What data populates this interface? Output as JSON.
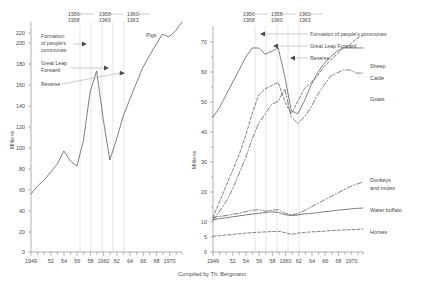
{
  "caption": "Compiled by Th. Bergmann",
  "axis_title": "Millions",
  "periods": [
    {
      "line1": "1956-",
      "line2": "1958"
    },
    {
      "line1": "1958-",
      "line2": "1960"
    },
    {
      "line1": "1960-",
      "line2": "1963"
    }
  ],
  "annotations": {
    "communes_l1": "Formation",
    "communes_l2": "of people's",
    "communes_l3": "communes",
    "glf_l1": "Great Leap",
    "glf_l2": "Forward",
    "reverse": "Reverse",
    "communes_full": "Formation of people's communes",
    "glf_full": "Great Leap Forward",
    "reverse_full": "Reverse"
  },
  "chart_data": [
    {
      "type": "line",
      "title": "",
      "xlabel": "",
      "ylabel": "Millions",
      "xlim": [
        1949,
        1972
      ],
      "ylim": [
        0,
        230
      ],
      "yticks": [
        0,
        20,
        40,
        60,
        80,
        100,
        120,
        140,
        160,
        180,
        200,
        220
      ],
      "xticks": [
        1949,
        1952,
        1954,
        1956,
        1958,
        1960,
        1962,
        1964,
        1966,
        1968,
        1970
      ],
      "xticklabels": [
        "1949",
        "52",
        "54",
        "56",
        "58",
        "1960",
        "62",
        "64",
        "66",
        "68",
        "1970"
      ],
      "grid": false,
      "legend": "inline",
      "series": [
        {
          "name": "Pigs",
          "style": "solid",
          "x": [
            1949,
            1950,
            1951,
            1952,
            1953,
            1954,
            1955,
            1956,
            1957,
            1958,
            1959,
            1960,
            1961,
            1962,
            1963,
            1964,
            1965,
            1966,
            1967,
            1968,
            1969,
            1970,
            1971,
            1972
          ],
          "values": [
            58,
            66,
            72,
            80,
            88,
            101,
            91,
            86,
            112,
            160,
            181,
            133,
            92,
            112,
            135,
            152,
            168,
            184,
            196,
            207,
            218,
            215,
            221,
            230
          ]
        }
      ]
    },
    {
      "type": "line",
      "title": "",
      "xlabel": "",
      "ylabel": "Millions",
      "xlim": [
        1949,
        1972
      ],
      "ylim": [
        0,
        72
      ],
      "yticks": [
        0,
        10,
        20,
        30,
        40,
        50,
        60,
        70
      ],
      "xticks": [
        1949,
        1952,
        1954,
        1956,
        1958,
        1960,
        1962,
        1964,
        1966,
        1968,
        1970
      ],
      "xticklabels": [
        "1949",
        "52",
        "54",
        "56",
        "58",
        "1960",
        "62",
        "64",
        "66",
        "68",
        "1970"
      ],
      "grid": false,
      "legend": "right-inline",
      "series": [
        {
          "name": "Sheep",
          "style": "solid",
          "x": [
            1949,
            1950,
            1951,
            1952,
            1953,
            1954,
            1955,
            1956,
            1957,
            1958,
            1959,
            1960,
            1961,
            1962,
            1963,
            1964,
            1965,
            1966,
            1967,
            1968,
            1969,
            1970,
            1971,
            1972
          ],
          "values": [
            43,
            46,
            50,
            54,
            58,
            62,
            65,
            65,
            63,
            64,
            65,
            56,
            45,
            44,
            48,
            53,
            57,
            60,
            62,
            64,
            65,
            65,
            65,
            65
          ]
        },
        {
          "name": "Cattle",
          "style": "dashed",
          "x": [
            1949,
            1950,
            1951,
            1952,
            1953,
            1954,
            1955,
            1956,
            1957,
            1958,
            1959,
            1960,
            1961,
            1962,
            1963,
            1964,
            1965,
            1966,
            1967,
            1968,
            1969,
            1970,
            1971,
            1972
          ],
          "values": [
            11,
            16,
            21,
            26,
            31,
            37,
            44,
            50,
            52,
            53,
            54,
            48,
            44,
            48,
            52,
            54,
            56,
            59,
            61,
            63,
            65,
            66,
            68,
            69
          ]
        },
        {
          "name": "Goats",
          "style": "dashdot",
          "x": [
            1949,
            1950,
            1951,
            1952,
            1953,
            1954,
            1955,
            1956,
            1957,
            1958,
            1959,
            1960,
            1961,
            1962,
            1963,
            1964,
            1965,
            1966,
            1967,
            1968,
            1969,
            1970,
            1971,
            1972
          ],
          "values": [
            10,
            13,
            16,
            20,
            25,
            30,
            36,
            41,
            44,
            47,
            48,
            52,
            43,
            41,
            43,
            46,
            50,
            53,
            56,
            57,
            58,
            58,
            57,
            57
          ]
        },
        {
          "name": "Donkeys and mules",
          "style": "dashdot",
          "x": [
            1949,
            1950,
            1951,
            1952,
            1953,
            1954,
            1955,
            1956,
            1957,
            1958,
            1959,
            1960,
            1961,
            1962,
            1963,
            1964,
            1965,
            1966,
            1967,
            1968,
            1969,
            1970,
            1971,
            1972
          ],
          "values": [
            11,
            11.3,
            11.6,
            12,
            12.4,
            12.8,
            13.3,
            13.5,
            13,
            13.3,
            13.5,
            12.4,
            11.8,
            12.2,
            13.2,
            14.3,
            15.4,
            16.5,
            17.6,
            18.6,
            19.8,
            20.8,
            21.6,
            22.3
          ]
        },
        {
          "name": "Water buffalo",
          "style": "solid",
          "x": [
            1949,
            1950,
            1951,
            1952,
            1953,
            1954,
            1955,
            1956,
            1957,
            1958,
            1959,
            1960,
            1961,
            1962,
            1963,
            1964,
            1965,
            1966,
            1967,
            1968,
            1969,
            1970,
            1971,
            1972
          ],
          "values": [
            10.3,
            10.6,
            10.9,
            11.2,
            11.5,
            11.8,
            12.1,
            12.3,
            12.6,
            12.8,
            12.6,
            11.9,
            11.6,
            11.8,
            12.1,
            12.3,
            12.5,
            12.8,
            13,
            13.3,
            13.5,
            13.7,
            13.9,
            14
          ]
        },
        {
          "name": "Horses",
          "style": "dashed",
          "x": [
            1949,
            1950,
            1951,
            1952,
            1953,
            1954,
            1955,
            1956,
            1957,
            1958,
            1959,
            1960,
            1961,
            1962,
            1963,
            1964,
            1965,
            1966,
            1967,
            1968,
            1969,
            1970,
            1971,
            1972
          ],
          "values": [
            5,
            5.2,
            5.4,
            5.6,
            5.8,
            6,
            6.2,
            6.3,
            6.4,
            6.5,
            6.6,
            6.2,
            5.6,
            6,
            6.2,
            6.4,
            6.5,
            6.6,
            6.8,
            6.9,
            7,
            7.1,
            7.2,
            7.3
          ]
        }
      ]
    }
  ]
}
